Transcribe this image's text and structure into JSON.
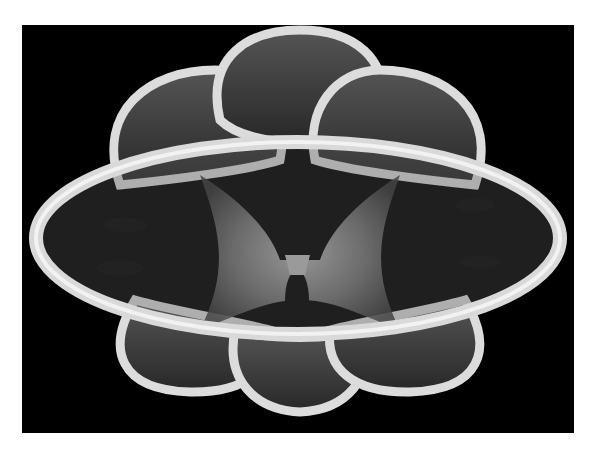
{
  "image": {
    "subject": "3D rendered glass-like mathematical surface with tubular rims",
    "background_color": "#000000",
    "border_color": "#ffffff",
    "palette": [
      "#000000",
      "#3a3a3a",
      "#7a7a7a",
      "#bdbdbd",
      "#f2f2f2"
    ],
    "alt": "Monochrome render of a translucent glass surface with a large central elliptical ring and petal-shaped lobes above and below"
  }
}
